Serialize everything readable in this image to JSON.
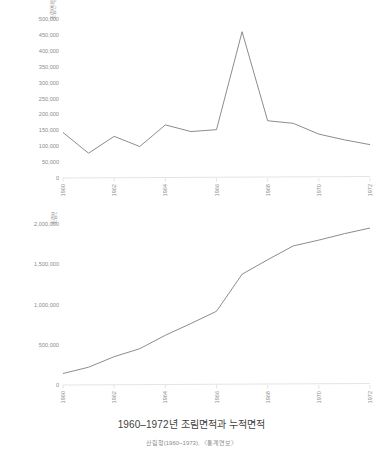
{
  "figure": {
    "title": "1960–1972년 조림면적과 누적면적",
    "source": "산림청(1960~1973), 〈통계연보〉"
  },
  "chart_data": [
    {
      "type": "line",
      "id": "annual-afforestation",
      "title": "",
      "xlabel": "",
      "ylabel": "조림면적 ( ha )",
      "x": [
        1960,
        1961,
        1962,
        1963,
        1964,
        1965,
        1966,
        1967,
        1968,
        1969,
        1970,
        1971,
        1972
      ],
      "values": [
        143000,
        78000,
        131000,
        99000,
        167000,
        146000,
        152000,
        460000,
        180000,
        172000,
        138000,
        120000,
        105000
      ],
      "tick_labels_x": [
        "1960",
        "1962",
        "1964",
        "1966",
        "1968",
        "1970",
        "1972"
      ],
      "tick_values_y": [
        0,
        50000,
        100000,
        150000,
        200000,
        250000,
        300000,
        350000,
        400000,
        450000,
        500000
      ],
      "tick_labels_y": [
        "0",
        "50,000",
        "100,000",
        "150,000",
        "200,000",
        "250,000",
        "300,000",
        "350,000",
        "400,000",
        "450,000",
        "500,000"
      ],
      "ylim": [
        0,
        500000
      ],
      "xlim": [
        1960,
        1972
      ],
      "grid": false,
      "legend": "none",
      "line_color": "#7f7f7f"
    },
    {
      "type": "line",
      "id": "cumulative-afforestation",
      "title": "",
      "xlabel": "",
      "ylabel": "조림면적 누계 ( ha )",
      "x": [
        1960,
        1961,
        1962,
        1963,
        1964,
        1965,
        1966,
        1967,
        1968,
        1969,
        1970,
        1971,
        1972
      ],
      "values": [
        143000,
        221000,
        352000,
        451000,
        618000,
        764000,
        916000,
        1376000,
        1556000,
        1728000,
        1800000,
        1880000,
        1950000
      ],
      "tick_labels_x": [
        "1960",
        "1962",
        "1964",
        "1966",
        "1968",
        "1970",
        "1972"
      ],
      "tick_values_y": [
        0,
        500000,
        1000000,
        1500000,
        2000000
      ],
      "tick_labels_y": [
        "0",
        "500,000",
        "1,000,000",
        "1,500,000",
        "2,000,000"
      ],
      "ylim": [
        0,
        2000000
      ],
      "xlim": [
        1960,
        1972
      ],
      "grid": false,
      "legend": "none",
      "line_color": "#7f7f7f"
    }
  ]
}
